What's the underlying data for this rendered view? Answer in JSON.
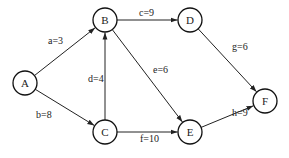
{
  "diagram": {
    "type": "directed-weighted-graph",
    "colors": {
      "stroke": "#222222",
      "background": "#ffffff",
      "text": "#222222"
    },
    "node_radius": 12,
    "nodes": [
      {
        "id": "A",
        "label": "A",
        "x": 25,
        "y": 83
      },
      {
        "id": "B",
        "label": "B",
        "x": 105,
        "y": 20
      },
      {
        "id": "C",
        "label": "C",
        "x": 105,
        "y": 132
      },
      {
        "id": "D",
        "label": "D",
        "x": 190,
        "y": 20
      },
      {
        "id": "E",
        "label": "E",
        "x": 190,
        "y": 132
      },
      {
        "id": "F",
        "label": "F",
        "x": 265,
        "y": 101
      }
    ],
    "edges": [
      {
        "id": "a",
        "from": "A",
        "to": "B",
        "label": "a=3",
        "lx": 48,
        "ly": 44
      },
      {
        "id": "b",
        "from": "A",
        "to": "C",
        "label": "b=8",
        "lx": 36,
        "ly": 118
      },
      {
        "id": "c",
        "from": "B",
        "to": "D",
        "label": "c=9",
        "lx": 139,
        "ly": 16
      },
      {
        "id": "d",
        "from": "C",
        "to": "B",
        "label": "d=4",
        "lx": 88,
        "ly": 82
      },
      {
        "id": "e",
        "from": "B",
        "to": "E",
        "label": "e=6",
        "lx": 153,
        "ly": 73
      },
      {
        "id": "f",
        "from": "C",
        "to": "E",
        "label": "f=10",
        "lx": 140,
        "ly": 142
      },
      {
        "id": "g",
        "from": "D",
        "to": "F",
        "label": "g=6",
        "lx": 232,
        "ly": 50
      },
      {
        "id": "h",
        "from": "E",
        "to": "F",
        "label": "h=9",
        "lx": 232,
        "ly": 116
      }
    ]
  }
}
